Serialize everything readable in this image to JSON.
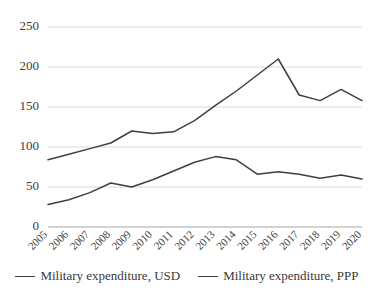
{
  "chart_data": {
    "type": "line",
    "title": "",
    "xlabel": "",
    "ylabel": "",
    "categories": [
      "2005",
      "2006",
      "2007",
      "2008",
      "2009",
      "2010",
      "2011",
      "2012",
      "2013",
      "2014",
      "2015",
      "2016",
      "2017",
      "2018",
      "2019",
      "2020"
    ],
    "series": [
      {
        "name": "Military expenditure, USD",
        "color": "#3f3f3f",
        "values": [
          28,
          34,
          43,
          55,
          50,
          59,
          70,
          81,
          88,
          84,
          66,
          69,
          66,
          61,
          65,
          60
        ]
      },
      {
        "name": "Military expenditure, PPP",
        "color": "#3f3f3f",
        "values": [
          84,
          91,
          98,
          105,
          120,
          117,
          119,
          133,
          152,
          170,
          190,
          210,
          165,
          158,
          172,
          158
        ]
      }
    ],
    "ylim": [
      0,
      250
    ],
    "yticks": [
      0,
      50,
      100,
      150,
      200,
      250
    ],
    "ytick_labels": [
      "0",
      "50",
      "100",
      "150",
      "200",
      "250"
    ],
    "grid": true,
    "grid_axis": "y",
    "legend_position": "bottom",
    "x_tick_rotation": 45
  },
  "legend": {
    "items": [
      {
        "label": "Military expenditure, USD"
      },
      {
        "label": "Military expenditure, PPP"
      }
    ]
  }
}
